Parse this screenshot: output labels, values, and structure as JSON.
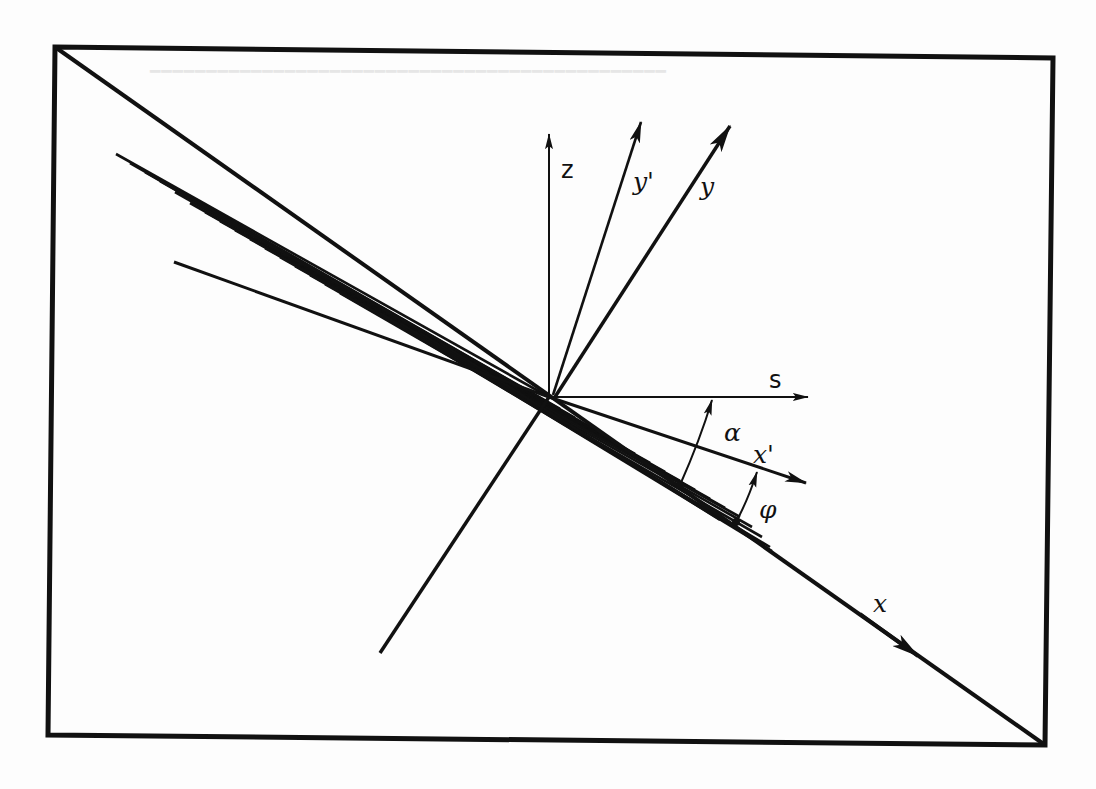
{
  "figure": {
    "type": "coordinate-system-diagram",
    "colors": {
      "ink": "#111111",
      "paper": "#fdfdfd",
      "bleed_text": "#e6e6e6"
    },
    "axes": {
      "z": "z",
      "y_prime": "y'",
      "y": "y",
      "s": "s",
      "x_prime": "x'",
      "x": "x"
    },
    "angles": {
      "alpha": "α",
      "phi": "φ"
    }
  }
}
